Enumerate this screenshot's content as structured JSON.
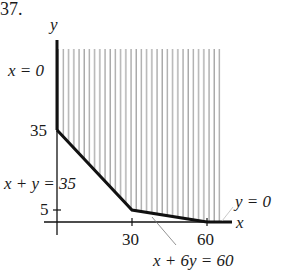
{
  "problem_number": "37.",
  "axes": {
    "x_label": "x",
    "y_label": "y"
  },
  "ticks": {
    "y": [
      "35",
      "5"
    ],
    "x": [
      "30",
      "60"
    ]
  },
  "constraints": {
    "x_axis_line": "x = 0",
    "diag_line": "x + y = 35",
    "shallow_line": "x + 6y = 60",
    "y_axis_line": "y = 0"
  },
  "vertices": [
    [
      0,
      35
    ],
    [
      30,
      5
    ],
    [
      60,
      0
    ]
  ],
  "colors": {
    "boundary": "#111111",
    "hatch": "#8a8a8a"
  }
}
